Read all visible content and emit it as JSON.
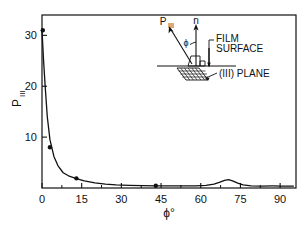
{
  "chart_data": {
    "type": "line",
    "title": "",
    "xlabel": "ϕ°",
    "ylabel": "P",
    "ylabel_sub": "III",
    "xlim": [
      0,
      96
    ],
    "ylim": [
      0,
      34
    ],
    "xticks": [
      0,
      15,
      30,
      45,
      60,
      75,
      90
    ],
    "xticklabels": [
      "0",
      "15",
      "30",
      "45",
      "60",
      "75",
      "90"
    ],
    "xminorticks": [
      7.5,
      22.5,
      37.5,
      52.5,
      67.5,
      82.5
    ],
    "yticks": [
      10,
      20,
      30
    ],
    "yticklabels": [
      "10",
      "20",
      "30"
    ],
    "grid": false,
    "legend": "none",
    "series": [
      {
        "name": "P111 vs phi",
        "x": [
          0,
          0.6,
          1.2,
          2,
          3,
          4.5,
          6,
          8,
          10,
          13,
          16,
          20,
          24,
          28,
          33,
          38,
          43,
          48,
          53,
          58,
          62,
          65,
          67,
          69,
          70.5,
          72,
          74,
          76,
          79,
          83,
          87,
          91,
          95
        ],
        "y": [
          31,
          25,
          20,
          14,
          9.5,
          6.2,
          4.4,
          3.0,
          2.4,
          1.85,
          1.4,
          1.0,
          0.75,
          0.6,
          0.5,
          0.45,
          0.42,
          0.4,
          0.4,
          0.42,
          0.5,
          0.75,
          1.1,
          1.5,
          1.65,
          1.4,
          0.95,
          0.6,
          0.42,
          0.38,
          0.4,
          0.38,
          0.36
        ]
      }
    ],
    "markers": [
      {
        "x": 0.3,
        "y": 31.0
      },
      {
        "x": 3.0,
        "y": 8.0
      },
      {
        "x": 13.0,
        "y": 1.9
      },
      {
        "x": 43.0,
        "y": 0.45
      }
    ]
  },
  "inset": {
    "vector_p_label": "P",
    "vector_p_sub": "III",
    "vector_n_label": "n",
    "angle_label": "ϕ",
    "film_surface_line1": "FILM",
    "film_surface_line2": "SURFACE",
    "plane_label": "(III) PLANE"
  },
  "colors": {
    "axis": "#111111",
    "curve": "#111111",
    "marker": "#111111",
    "background": "#ffffff",
    "text": "#111111"
  }
}
